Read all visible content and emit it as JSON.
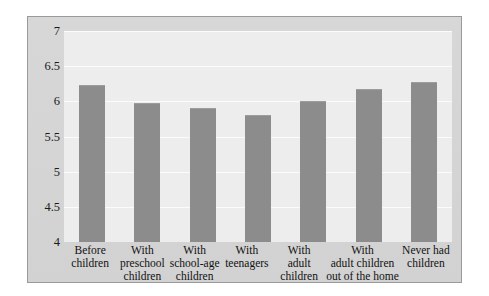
{
  "chart_data": {
    "type": "bar",
    "title": "",
    "subtitle": "",
    "xlabel": "",
    "ylabel": "",
    "ylim": [
      4,
      7
    ],
    "yticks": [
      7,
      6.5,
      6,
      5.5,
      5,
      4.5,
      4
    ],
    "ytick_labels": [
      "7",
      "6.5",
      "6",
      "5.5",
      "5",
      "4.5",
      "4"
    ],
    "grid": true,
    "legend": "none",
    "categories": [
      "Before children",
      "With preschool children",
      "With school-age children",
      "With teenagers",
      "With adult children",
      "With adult children out of the home",
      "Never had children"
    ],
    "category_lines": [
      [
        "Before",
        "children"
      ],
      [
        "With",
        "preschool",
        "children"
      ],
      [
        "With",
        "school-age",
        "children"
      ],
      [
        "With",
        "teenagers"
      ],
      [
        "With",
        "adult",
        "children"
      ],
      [
        "With",
        "adult children",
        "out of the home"
      ],
      [
        "Never had",
        "children"
      ]
    ],
    "values": [
      6.23,
      5.97,
      5.9,
      5.8,
      6.0,
      6.18,
      6.28
    ],
    "bar_color": "#8c8c8c",
    "plot_background": "#ededed",
    "figure_background": "#d5d5d5",
    "gridline_color": "#fbfbfb",
    "border_color": "#9a9a9a"
  }
}
